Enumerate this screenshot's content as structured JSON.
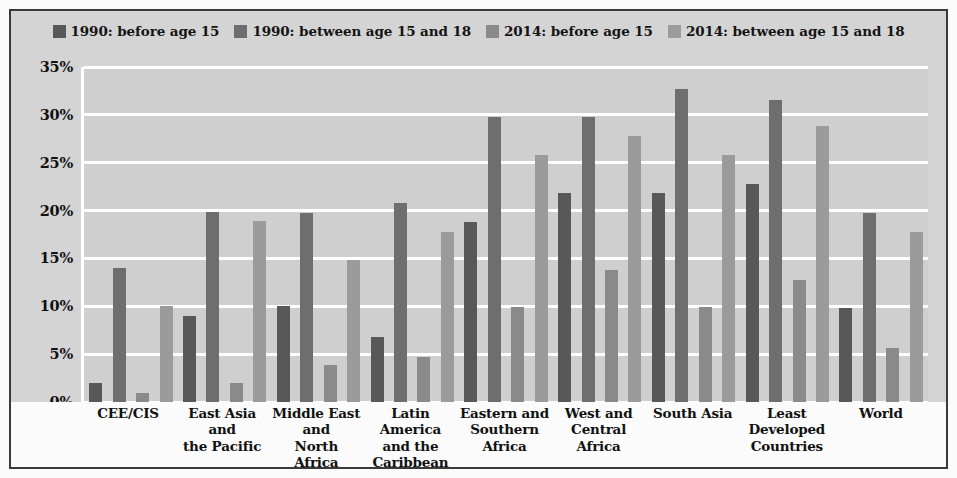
{
  "chart_data": {
    "type": "bar",
    "title": "",
    "subtitle": "",
    "xlabel": "",
    "ylabel": "",
    "ylim": [
      0,
      35
    ],
    "ytick_labels": [
      "0%",
      "5%",
      "10%",
      "15%",
      "20%",
      "25%",
      "30%",
      "35%"
    ],
    "ytick_values": [
      0,
      5,
      10,
      15,
      20,
      25,
      30,
      35
    ],
    "grid": true,
    "legend_position": "top-center",
    "categories": [
      "CEE/CIS",
      "East Asia and the Pacific",
      "Middle East and North Africa",
      "Latin America and the Caribbean",
      "Eastern and Southern Africa",
      "West and Central Africa",
      "South Asia",
      "Least Developed Countries",
      "World"
    ],
    "category_lines": [
      [
        "CEE/CIS"
      ],
      [
        "East Asia and",
        "the Pacific"
      ],
      [
        "Middle East",
        "and",
        "North Africa"
      ],
      [
        "Latin America",
        "and the",
        "Caribbean"
      ],
      [
        "Eastern and",
        "Southern",
        "Africa"
      ],
      [
        "West and",
        "Central Africa"
      ],
      [
        "South Asia"
      ],
      [
        "Least Developed",
        "Countries"
      ],
      [
        "World"
      ]
    ],
    "series": [
      {
        "name": "1990: before age 15",
        "color": "#585858",
        "values": [
          2.0,
          9.0,
          10.0,
          6.8,
          18.8,
          21.8,
          21.8,
          22.8,
          9.8
        ]
      },
      {
        "name": "1990: between age 15 and 18",
        "color": "#6e6e6e",
        "values": [
          14.0,
          19.9,
          19.8,
          20.8,
          29.8,
          29.8,
          32.7,
          31.6,
          19.7
        ]
      },
      {
        "name": "2014: before age 15",
        "color": "#8a8a8a",
        "values": [
          0.9,
          2.0,
          3.9,
          4.7,
          9.9,
          13.8,
          9.9,
          12.7,
          5.6
        ]
      },
      {
        "name": "2014: between age 15 and 18",
        "color": "#9b9b9b",
        "values": [
          10.0,
          18.9,
          14.8,
          17.8,
          25.8,
          27.8,
          25.8,
          28.8,
          17.8
        ]
      }
    ]
  },
  "style": {
    "plot_background": "#cfcfcf",
    "figure_background": "#fbfbfb",
    "frame_border": "#3a3a3a",
    "gridline_color": "#ffffff",
    "text_color": "#111111"
  }
}
